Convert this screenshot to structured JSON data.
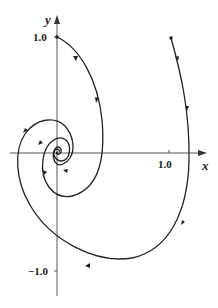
{
  "diagram": {
    "type": "phase-portrait",
    "axes": {
      "x_label": "x",
      "y_label": "y",
      "x_ticks": [
        {
          "value": 1.0,
          "label": "1.0"
        }
      ],
      "y_ticks": [
        {
          "value": 1.0,
          "label": "1.0"
        },
        {
          "value": -1.0,
          "label": "−1.0"
        }
      ]
    },
    "trajectories": [
      {
        "name": "trajectory-from-0-1",
        "start": [
          0,
          1.0
        ],
        "end": [
          0,
          0
        ],
        "direction": "clockwise-spiral-inward"
      },
      {
        "name": "trajectory-from-1.05-1",
        "start": [
          1.05,
          1.0
        ],
        "end": [
          0,
          0
        ],
        "direction": "clockwise-spiral-inward"
      }
    ],
    "equilibrium": {
      "point": [
        0,
        0
      ],
      "type": "stable spiral"
    },
    "colors": {
      "curve": "#222222",
      "axis": "#444444"
    }
  }
}
